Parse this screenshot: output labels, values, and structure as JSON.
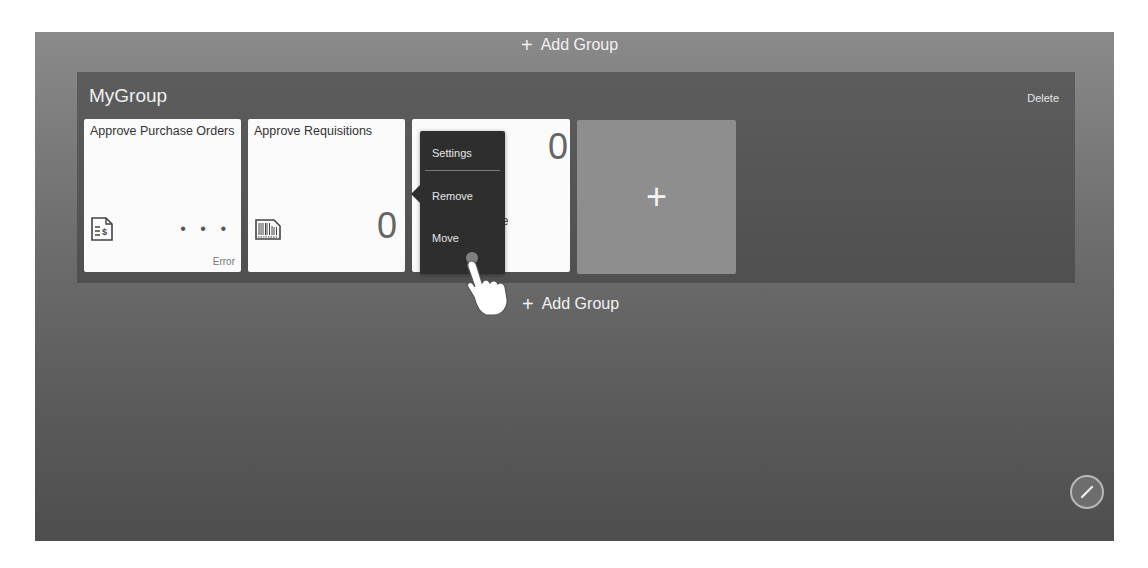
{
  "top_add_group": {
    "icon": "plus-icon",
    "label": "Add Group"
  },
  "bottom_add_group": {
    "icon": "plus-icon",
    "label": "Add Group"
  },
  "group": {
    "title": "MyGroup",
    "delete_label": "Delete",
    "tiles": [
      {
        "title": "Approve Purchase Orders",
        "icon": "purchase-order-dollar-icon",
        "value": "...",
        "status": "Error"
      },
      {
        "title": "Approve Requisitions",
        "icon": "barcode-document-icon",
        "value": "0",
        "status": ""
      },
      {
        "title_partial": "ave",
        "value": "0",
        "status": ""
      }
    ],
    "add_tile": {
      "icon": "plus-icon",
      "label": "+"
    }
  },
  "context_menu": {
    "items": [
      {
        "label": "Settings",
        "active": true
      },
      {
        "label": "Remove"
      },
      {
        "label": "Move"
      }
    ]
  },
  "edit_button": {
    "icon": "pencil-icon"
  },
  "colors": {
    "screen_bg": "#6e6e6e",
    "group_bg": "#4a4a4a",
    "tile_bg": "#fbfbfb",
    "add_tile_bg": "#8e8e8e",
    "menu_bg": "#2e2e2e"
  }
}
